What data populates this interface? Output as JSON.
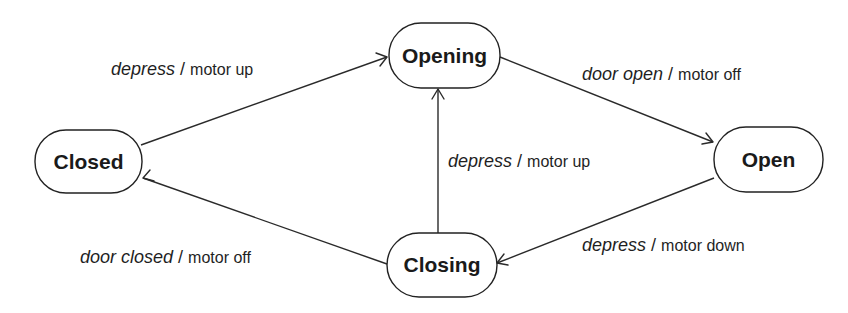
{
  "diagram": {
    "title": "",
    "type": "state-machine",
    "theme": {
      "background": "#ffffff",
      "stroke": "#222222",
      "text": "#1a1a1a"
    },
    "states": [
      {
        "id": "closed",
        "label": "Closed",
        "x": 35,
        "y": 130,
        "w": 107,
        "h": 63
      },
      {
        "id": "opening",
        "label": "Opening",
        "x": 389,
        "y": 23,
        "w": 111,
        "h": 65
      },
      {
        "id": "open",
        "label": "Open",
        "x": 714,
        "y": 127,
        "w": 109,
        "h": 65
      },
      {
        "id": "closing",
        "label": "Closing",
        "x": 387,
        "y": 233,
        "w": 110,
        "h": 64
      }
    ],
    "transitions": [
      {
        "id": "closed-to-opening",
        "from": "Closed",
        "to": "Opening",
        "event": "depress",
        "separator": " / ",
        "action": "motor up"
      },
      {
        "id": "opening-to-open",
        "from": "Opening",
        "to": "Open",
        "event": "door open",
        "separator": " / ",
        "action": "motor off"
      },
      {
        "id": "closing-to-opening",
        "from": "Closing",
        "to": "Opening",
        "event": "depress",
        "separator": " / ",
        "action": "motor up"
      },
      {
        "id": "open-to-closing",
        "from": "Open",
        "to": "Closing",
        "event": "depress",
        "separator": " / ",
        "action": "motor down"
      },
      {
        "id": "closing-to-closed",
        "from": "Closing",
        "to": "Closed",
        "event": "door closed",
        "separator": " / ",
        "action": "motor off"
      }
    ]
  }
}
